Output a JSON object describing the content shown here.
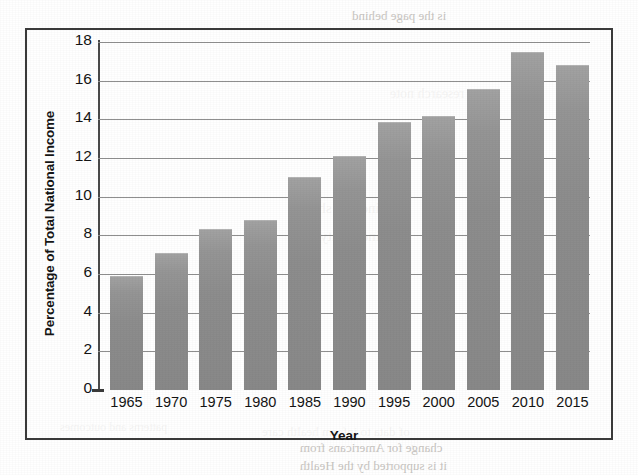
{
  "chart_data": {
    "type": "bar",
    "title": "",
    "xlabel": "Year",
    "ylabel": "Percentage of Total National Income",
    "categories": [
      "1965",
      "1970",
      "1975",
      "1980",
      "1985",
      "1990",
      "1995",
      "2000",
      "2005",
      "2010",
      "2015"
    ],
    "values": [
      5.9,
      7.1,
      8.35,
      8.8,
      11.0,
      12.1,
      13.85,
      14.15,
      15.55,
      17.5,
      16.8
    ],
    "ylim": [
      0,
      18
    ],
    "ytick_values": [
      0,
      2,
      4,
      6,
      8,
      10,
      12,
      14,
      16,
      18
    ],
    "ytick_labels": [
      "0",
      "2",
      "4",
      "6",
      "8",
      "10",
      "12",
      "14",
      "16",
      "18"
    ],
    "grid": true,
    "grid_axis": "y",
    "legend": false,
    "bar_color": "#8d8d8d",
    "series": [
      {
        "name": "Percentage of Total National Income",
        "values": [
          5.9,
          7.1,
          8.35,
          8.8,
          11.0,
          12.1,
          13.85,
          14.15,
          15.55,
          17.5,
          16.8
        ]
      }
    ]
  },
  "figure": {
    "frame_color": "#3b3b3b",
    "background": "#ffffff"
  },
  "bleed_text": {
    "a": "is the page behind",
    "b": "research note",
    "c": "income share",
    "d": "inequality",
    "e": "of data to inform health care",
    "f": "change for Americans from",
    "g": "it is supported by the Health",
    "h": "patterns and outcomes"
  }
}
